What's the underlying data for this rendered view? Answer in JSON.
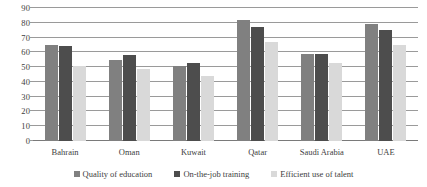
{
  "chart_data": {
    "type": "bar",
    "title": "",
    "subtitle": "",
    "xlabel": "",
    "ylabel": "",
    "ylim": [
      0,
      90
    ],
    "ytick_step": 10,
    "yticks": [
      90,
      80,
      70,
      60,
      50,
      40,
      30,
      20,
      10,
      0
    ],
    "grid": true,
    "grid_axis": "y",
    "legend_position": "bottom",
    "categories": [
      "Bahrain",
      "Oman",
      "Kuwait",
      "Qatar",
      "Saudi Arabia",
      "UAE"
    ],
    "series": [
      {
        "name": "Quality of education",
        "color": "#808080",
        "values": [
          65,
          55,
          51,
          82,
          59,
          79
        ]
      },
      {
        "name": "On-the-job training",
        "color": "#4d4d4d",
        "values": [
          64,
          58,
          53,
          77,
          59,
          75
        ]
      },
      {
        "name": "Efficient use of talent",
        "color": "#d9d9d9",
        "values": [
          51,
          49,
          44,
          67,
          53,
          65
        ]
      }
    ]
  },
  "style": {
    "gridline_color": "#9a9a9a",
    "baseline_color": "#7a7a7a",
    "text_color": "#3d3d3d",
    "background": "#ffffff"
  }
}
